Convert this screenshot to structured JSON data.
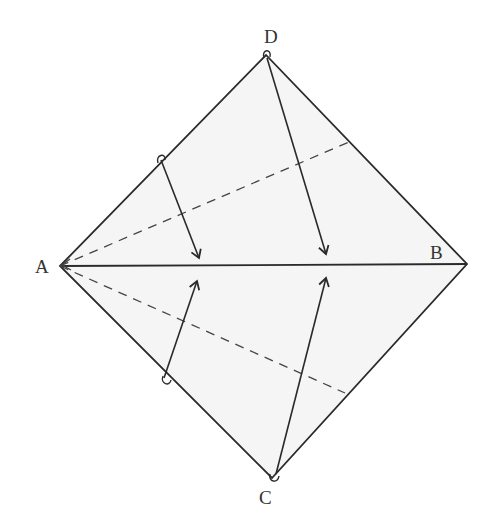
{
  "diagram": {
    "type": "fold-diagram",
    "colors": {
      "stroke": "#2a2a2a",
      "fill": "#f5f5f5",
      "dash": "#444444"
    },
    "vertices": {
      "A": {
        "label": "A",
        "x": 60,
        "y": 266
      },
      "B": {
        "label": "B",
        "x": 467,
        "y": 264
      },
      "C": {
        "label": "C",
        "x": 272,
        "y": 478
      },
      "D": {
        "label": "D",
        "x": 266,
        "y": 55
      }
    },
    "edges": [
      {
        "from": "A",
        "to": "D",
        "style": "solid"
      },
      {
        "from": "D",
        "to": "B",
        "style": "solid"
      },
      {
        "from": "B",
        "to": "C",
        "style": "solid"
      },
      {
        "from": "C",
        "to": "A",
        "style": "solid"
      },
      {
        "from": "A",
        "to": "B",
        "style": "solid",
        "note": "diagonal"
      }
    ],
    "creases": [
      {
        "from": [
          60,
          266
        ],
        "to": [
          349,
          142
        ],
        "style": "dashed"
      },
      {
        "from": [
          60,
          266
        ],
        "to": [
          345,
          393
        ],
        "style": "dashed"
      }
    ],
    "arrows": [
      {
        "from": [
          161,
          160
        ],
        "to": [
          199,
          258
        ],
        "direction": "down"
      },
      {
        "from": [
          267,
          58
        ],
        "to": [
          326,
          254
        ],
        "direction": "down"
      },
      {
        "from": [
          164,
          378
        ],
        "to": [
          197,
          281
        ],
        "direction": "up"
      },
      {
        "from": [
          276,
          474
        ],
        "to": [
          326,
          278
        ],
        "direction": "up"
      }
    ]
  }
}
